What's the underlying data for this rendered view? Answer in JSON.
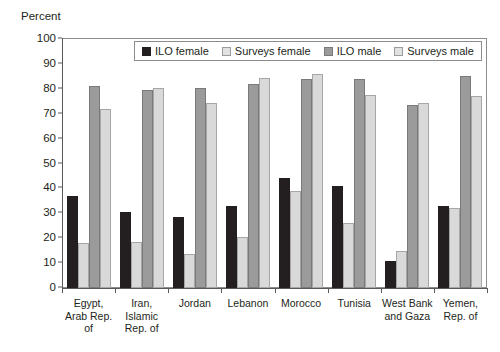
{
  "chart_data": {
    "type": "bar",
    "title": "",
    "xlabel": "",
    "ylabel": "Percent",
    "ylim": [
      0,
      100
    ],
    "yticks": [
      0,
      10,
      20,
      30,
      40,
      50,
      60,
      70,
      80,
      90,
      100
    ],
    "grid": false,
    "legend_position": "top-center",
    "categories": [
      "Egypt, Arab Rep. of",
      "Iran, Islamic Rep. of",
      "Jordan",
      "Lebanon",
      "Morocco",
      "Tunisia",
      "West Bank and Gaza",
      "Yemen, Rep. of"
    ],
    "series": [
      {
        "name": "ILO female",
        "color": "#231f20",
        "values": [
          37,
          30.5,
          28.5,
          33,
          44,
          41,
          11,
          33
        ]
      },
      {
        "name": "Surveys female",
        "color": "#d9d9d9",
        "values": [
          18,
          18.5,
          13.5,
          20.5,
          39,
          26,
          15,
          32
        ]
      },
      {
        "name": "ILO male",
        "color": "#9b9b9b",
        "values": [
          81,
          79.5,
          80.5,
          82,
          84,
          84,
          73.5,
          85
        ]
      },
      {
        "name": "Surveys male",
        "color": "#d9d9d9",
        "values": [
          72,
          80.5,
          74.5,
          84.5,
          86,
          77.5,
          74.5,
          77
        ]
      }
    ]
  },
  "legend": {
    "items": [
      {
        "label": "ILO female"
      },
      {
        "label": "Surveys female"
      },
      {
        "label": "ILO male"
      },
      {
        "label": "Surveys male"
      }
    ]
  }
}
